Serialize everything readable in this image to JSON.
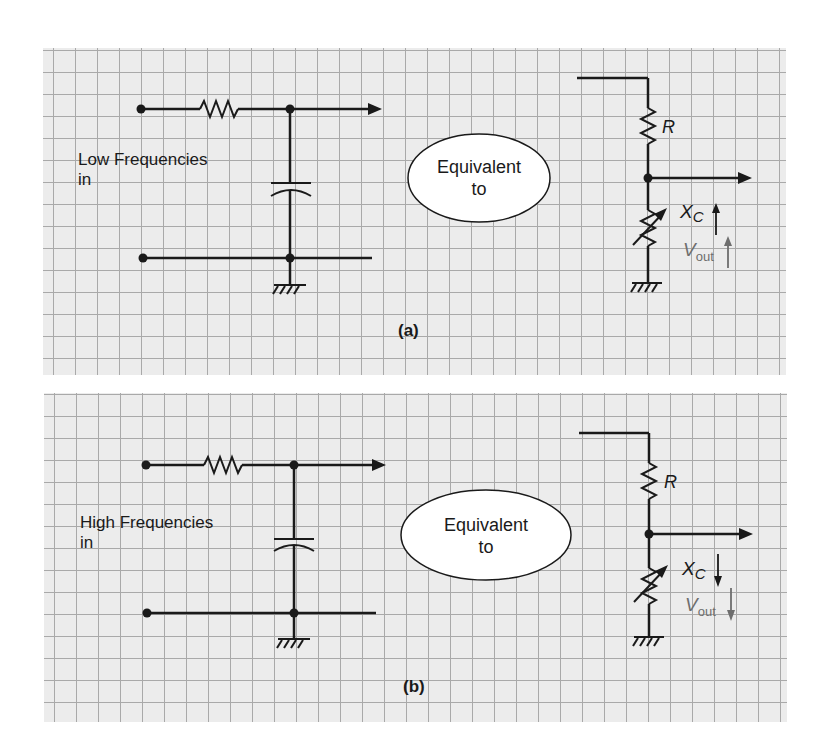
{
  "figure": {
    "panels": [
      {
        "id": "a",
        "caption": "(a)",
        "input_label_line1": "Low Frequencies",
        "input_label_line2": "in",
        "equivalence_line1": "Equivalent",
        "equivalence_line2": "to",
        "resistor_label": "R",
        "reactance_label_main": "X",
        "reactance_label_sub": "C",
        "reactance_trend": "up",
        "vout_label_main": "V",
        "vout_label_sub": "out",
        "vout_trend": "up"
      },
      {
        "id": "b",
        "caption": "(b)",
        "input_label_line1": "High Frequencies",
        "input_label_line2": "in",
        "equivalence_line1": "Equivalent",
        "equivalence_line2": "to",
        "resistor_label": "R",
        "reactance_label_main": "X",
        "reactance_label_sub": "C",
        "reactance_trend": "down",
        "vout_label_main": "V",
        "vout_label_sub": "out",
        "vout_trend": "down"
      }
    ],
    "colors": {
      "grid_background": "#ececec",
      "grid_line": "#a9a9a9",
      "wire": "#1a1a1a",
      "vout_annotation": "#6e6e6e"
    }
  }
}
